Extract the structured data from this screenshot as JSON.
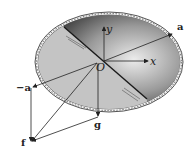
{
  "figure": {
    "labels": {
      "a_right": "a",
      "a_left": "−a",
      "y_axis": "y",
      "x_axis": "x",
      "origin": "O",
      "f": "f",
      "g": "g"
    },
    "colors": {
      "rim": "#555555",
      "rim_fill": "#f4f4f4",
      "light_surface": "#c4c4c4",
      "dark_surface_edge": "#4a4a4a",
      "dark_surface_center": "#e6e6e6",
      "line": "#222222"
    }
  }
}
